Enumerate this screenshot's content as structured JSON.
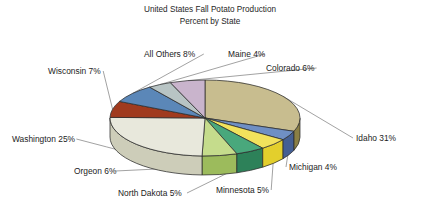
{
  "chart_data": {
    "type": "pie",
    "title": "United States Fall Potato Production",
    "subtitle": "Percent by State",
    "xlabel": "",
    "ylabel": "",
    "value_unit": "%",
    "three_d": true,
    "legend": "none",
    "labels_position": "outside-with-leader-lines",
    "categories": [
      "Idaho",
      "Washington",
      "All Others",
      "Wisconsin",
      "Colorado",
      "Orgeon",
      "North Dakota",
      "Minnesota",
      "Maine",
      "Michigan"
    ],
    "values": [
      31,
      25,
      8,
      7,
      6,
      6,
      5,
      5,
      4,
      4
    ],
    "total": 101,
    "slices": [
      {
        "name": "Idaho",
        "value": 31,
        "label": "Idaho 31%",
        "top_color": "#c8bd8f",
        "side_color": "#8a7f45"
      },
      {
        "name": "Michigan",
        "value": 4,
        "label": "Michigan 4%",
        "top_color": "#6f8fc4",
        "side_color": "#445f93"
      },
      {
        "name": "Minnesota",
        "value": 5,
        "label": "Minnesota 5%",
        "top_color": "#f2e25c",
        "side_color": "#e3cf2c"
      },
      {
        "name": "North Dakota",
        "value": 5,
        "label": "North Dakota 5%",
        "top_color": "#49a87c",
        "side_color": "#2d8159"
      },
      {
        "name": "Orgeon",
        "value": 6,
        "label": "Orgeon 6%",
        "top_color": "#c5dc8c",
        "side_color": "#9cbb5c"
      },
      {
        "name": "Washington",
        "value": 25,
        "label": "Washington 25%",
        "top_color": "#e8e8dc",
        "side_color": "#cdcdb9"
      },
      {
        "name": "Wisconsin",
        "value": 7,
        "label": "Wisconsin 7%",
        "top_color": "#a03a1e",
        "side_color": "#7a2a13"
      },
      {
        "name": "All Others",
        "value": 8,
        "label": "All Others 8%",
        "top_color": "#5b87b8",
        "side_color": "#3d6590"
      },
      {
        "name": "Maine",
        "value": 4,
        "label": "Maine 4%",
        "top_color": "#b8c4c4",
        "side_color": "#93a0a0"
      },
      {
        "name": "Colorado",
        "value": 6,
        "label": "Colorado 6%",
        "top_color": "#c9b4cc",
        "side_color": "#a78caa"
      }
    ],
    "annotations": [
      {
        "key": "all-others",
        "text": "All Others 8%",
        "x": 144,
        "y": 57,
        "anchor": "start"
      },
      {
        "key": "maine",
        "text": "Maine 4%",
        "x": 228,
        "y": 57,
        "anchor": "start"
      },
      {
        "key": "colorado",
        "text": "Colorado 6%",
        "x": 266,
        "y": 71,
        "anchor": "start"
      },
      {
        "key": "wisconsin",
        "text": "Wisconsin 7%",
        "x": 48,
        "y": 74,
        "anchor": "start"
      },
      {
        "key": "washington",
        "text": "Washington 25%",
        "x": 12,
        "y": 142,
        "anchor": "start"
      },
      {
        "key": "idaho",
        "text": "Idaho 31%",
        "x": 356,
        "y": 141,
        "anchor": "start"
      },
      {
        "key": "michigan",
        "text": "Michigan 4%",
        "x": 289,
        "y": 170,
        "anchor": "start"
      },
      {
        "key": "orgeon",
        "text": "Orgeon 6%",
        "x": 74,
        "y": 174,
        "anchor": "start"
      },
      {
        "key": "north-dakota",
        "text": "North Dakota 5%",
        "x": 118,
        "y": 196,
        "anchor": "start"
      },
      {
        "key": "minnesota",
        "text": "Minnesota 5%",
        "x": 216,
        "y": 193,
        "anchor": "start"
      }
    ]
  }
}
